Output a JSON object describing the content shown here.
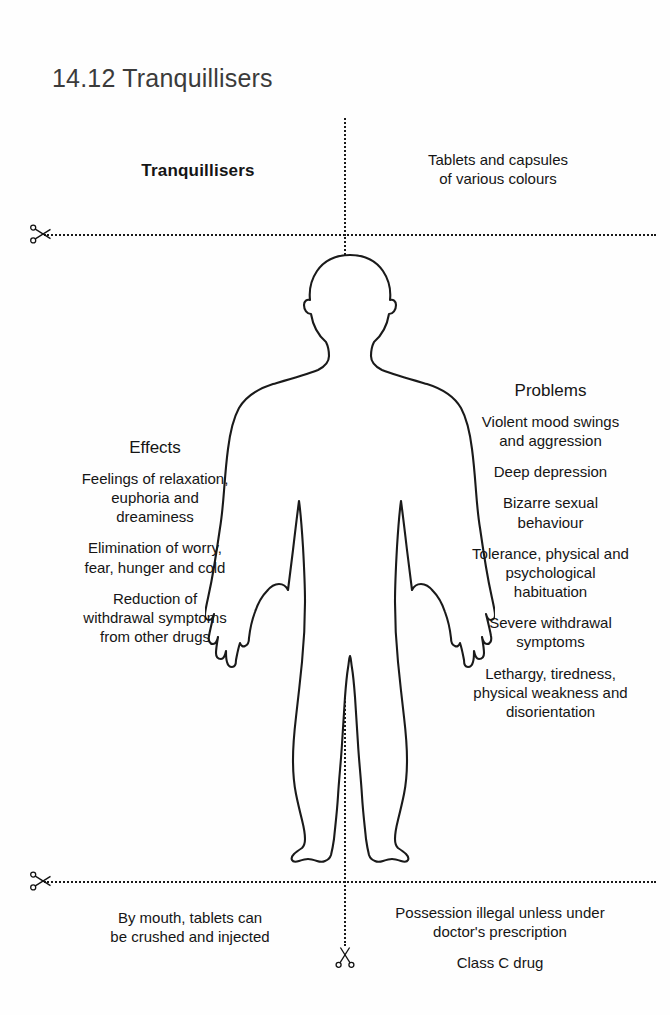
{
  "page": {
    "title": "14.12  Tranquillisers"
  },
  "quadrants": {
    "top_left": {
      "heading": "Tranquillisers"
    },
    "top_right": {
      "lines": [
        "Tablets and capsules",
        "of various colours"
      ]
    },
    "middle_left": {
      "heading": "Effects",
      "items": [
        [
          "Feelings of relaxation,",
          "euphoria and",
          "dreaminess"
        ],
        [
          "Elimination of worry,",
          "fear, hunger and cold"
        ],
        [
          "Reduction of",
          "withdrawal symptoms",
          "from other drugs"
        ]
      ]
    },
    "middle_right": {
      "heading": "Problems",
      "items": [
        [
          "Violent mood swings",
          "and aggression"
        ],
        [
          "Deep depression"
        ],
        [
          "Bizarre sexual",
          "behaviour"
        ],
        [
          "Tolerance, physical and",
          "psychological",
          "habituation"
        ],
        [
          "Severe withdrawal",
          "symptoms"
        ],
        [
          "Lethargy, tiredness,",
          "physical weakness and",
          "disorientation"
        ]
      ]
    },
    "bottom_left": {
      "lines": [
        "By mouth, tablets can",
        "be crushed and injected"
      ]
    },
    "bottom_right": {
      "items": [
        [
          "Possession illegal unless under",
          "doctor's prescription"
        ],
        [
          "Class C drug"
        ]
      ]
    }
  },
  "icons": {
    "scissors_top_left": "scissors-icon",
    "scissors_bottom_left": "scissors-icon",
    "scissors_vertical_bottom": "scissors-icon"
  },
  "figure": {
    "name": "human-body-outline"
  },
  "colors": {
    "background": "#fefefe",
    "text": "#151515",
    "title": "#3b3b3b",
    "line": "#1a1a1a"
  }
}
